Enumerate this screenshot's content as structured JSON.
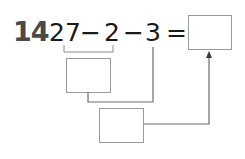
{
  "problem": {
    "number": "14",
    "expression": {
      "operand1": "27",
      "op1": "−",
      "operand2": "2",
      "op2": "−",
      "operand3": "3",
      "equals": "="
    },
    "answer_box": {
      "value": ""
    },
    "step_box_1": {
      "value": "",
      "meaning": "result of 27 − 2"
    },
    "step_box_2": {
      "value": "",
      "meaning": "result of (27 − 2) − 3"
    }
  },
  "colors": {
    "number": "#4a4a4a",
    "text": "#1a1a1a",
    "box_border": "#9a9a9a",
    "connector": "#6a6a6a"
  }
}
